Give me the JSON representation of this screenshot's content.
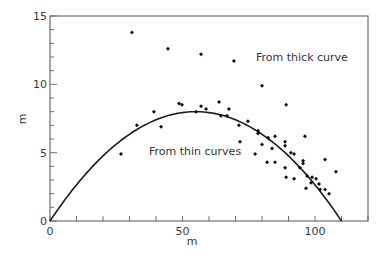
{
  "chart_data": {
    "type": "scatter",
    "title": "",
    "xlabel": "m",
    "ylabel": "m",
    "xlim": [
      0,
      120
    ],
    "ylim": [
      0,
      15
    ],
    "grid": false,
    "legend": null,
    "x_ticks": {
      "major": [
        0,
        50,
        100
      ],
      "major_labels": [
        "0",
        "50",
        "100"
      ],
      "minor_step": 10
    },
    "y_ticks": {
      "major": [
        0,
        5,
        10,
        15
      ],
      "major_labels": [
        "0",
        "5",
        "10",
        "15"
      ],
      "minor_step": 1
    },
    "annotations": [
      {
        "text": "From thick curve",
        "x": 87,
        "y": 12.3
      },
      {
        "text": "From thin curves",
        "x": 37,
        "y": 4.9
      }
    ],
    "series": [
      {
        "name": "From thick curve",
        "kind": "points",
        "marker": "diamond",
        "x": [
          30.9,
          44.5,
          57.0,
          69.4,
          80.0,
          89.1
        ],
        "y": [
          13.8,
          12.6,
          12.2,
          11.7,
          9.9,
          8.5
        ]
      },
      {
        "name": "From thin curves",
        "kind": "points",
        "marker": "diamond",
        "x": [
          26.8,
          32.8,
          39.2,
          41.9,
          48.7,
          49.8,
          55.1,
          57.0,
          58.9,
          63.8,
          64.5,
          66.8,
          67.5,
          71.3,
          71.7,
          74.7,
          77.4,
          78.5,
          78.5,
          80.0,
          82.3,
          81.9,
          83.8,
          84.9,
          84.9,
          88.7,
          88.7,
          88.7,
          89.1,
          90.9,
          92.1,
          92.1,
          94.3,
          95.5,
          95.5,
          96.2,
          96.6,
          97.0,
          98.5,
          98.9,
          100.4,
          101.5,
          101.9,
          103.8,
          103.8,
          105.3,
          107.9
        ],
        "y": [
          4.9,
          7.0,
          8.0,
          6.9,
          8.6,
          8.5,
          8.0,
          8.4,
          8.2,
          8.7,
          7.7,
          7.7,
          8.2,
          7.0,
          5.8,
          7.3,
          4.9,
          6.6,
          6.4,
          5.6,
          6.1,
          4.3,
          5.3,
          6.2,
          4.3,
          5.8,
          5.5,
          3.9,
          3.2,
          5.0,
          4.9,
          3.1,
          3.9,
          4.4,
          4.2,
          6.2,
          2.4,
          3.3,
          2.8,
          3.2,
          3.1,
          2.7,
          2.3,
          4.5,
          2.3,
          2.0,
          3.6
        ]
      },
      {
        "name": "Fitted curve",
        "kind": "line",
        "equation": "y = 8 * (1 - ((x - 55) / 55)^2)",
        "x_range": [
          0,
          110
        ],
        "peak": [
          55,
          8
        ]
      }
    ]
  },
  "colors": {
    "axis": "#6e6e6e",
    "points": "#111111",
    "curve": "#1a1a1a",
    "text": "#3a3a3a"
  }
}
